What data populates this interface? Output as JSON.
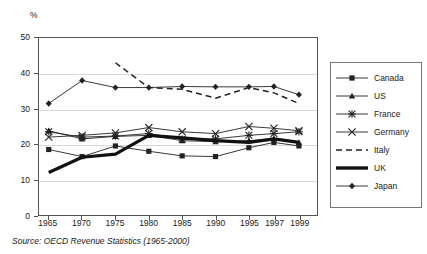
{
  "chart_data": {
    "type": "line",
    "title": "",
    "subtitle": "",
    "xlabel": "",
    "ylabel": "%",
    "unit_label": "%",
    "xlim": [
      1965,
      1999
    ],
    "ylim": [
      0,
      50
    ],
    "grid": true,
    "grid_axis": "y",
    "legend_position": "right",
    "x": [
      1965,
      1970,
      1975,
      1980,
      1985,
      1990,
      1995,
      1997,
      1999
    ],
    "xtick_labels": [
      "1965",
      "1970",
      "1975",
      "1980",
      "1985",
      "1990",
      "1995",
      "1997",
      "1999"
    ],
    "ytick_labels": [
      "0",
      "10",
      "20",
      "30",
      "40",
      "50"
    ],
    "ytick_values": [
      0,
      10,
      20,
      30,
      40,
      50
    ],
    "series": [
      {
        "name": "Canada",
        "marker": "square",
        "line": "solid",
        "color": "#222222",
        "values": [
          18.5,
          16.5,
          19.5,
          18.0,
          16.7,
          16.5,
          19.0,
          20.5,
          19.5
        ]
      },
      {
        "name": "US",
        "marker": "triangle",
        "line": "solid",
        "color": "#222222",
        "values": [
          23.8,
          21.5,
          22.2,
          22.5,
          21.0,
          20.7,
          21.0,
          21.5,
          20.5
        ]
      },
      {
        "name": "France",
        "marker": "asterisk",
        "line": "solid",
        "color": "#222222",
        "values": [
          23.5,
          22.0,
          22.3,
          23.0,
          21.4,
          21.5,
          22.5,
          23.0,
          23.5
        ]
      },
      {
        "name": "Germany",
        "marker": "cross",
        "line": "solid",
        "color": "#222222",
        "values": [
          22.0,
          22.5,
          23.2,
          24.7,
          23.5,
          23.0,
          25.0,
          24.5,
          23.8
        ]
      },
      {
        "name": "Italy",
        "marker": "none",
        "line": "dashed",
        "color": "#222222",
        "values": [
          null,
          null,
          43.0,
          36.0,
          35.5,
          33.0,
          36.0,
          34.5,
          31.5
        ]
      },
      {
        "name": "UK",
        "marker": "none",
        "line": "thick",
        "color": "#111111",
        "values": [
          12.0,
          16.3,
          17.2,
          22.5,
          21.8,
          21.0,
          20.5,
          21.5,
          20.5
        ]
      },
      {
        "name": "Japan",
        "marker": "diamond",
        "line": "solid",
        "color": "#222222",
        "values": [
          31.5,
          38.0,
          36.0,
          36.0,
          36.3,
          36.2,
          36.2,
          36.3,
          34.0
        ]
      }
    ]
  },
  "legend": {
    "items": [
      {
        "label": "Canada"
      },
      {
        "label": "US"
      },
      {
        "label": "France"
      },
      {
        "label": "Germany"
      },
      {
        "label": "Italy"
      },
      {
        "label": "UK"
      },
      {
        "label": "Japan"
      }
    ]
  },
  "caption": {
    "text": "Source: OECD Revenue Statistics (1965-2000)"
  },
  "colors": {
    "ink": "#1a1a1a",
    "frame": "#555555",
    "grid": "#d8d8d8",
    "legend_border": "#777777",
    "background": "#ffffff"
  }
}
